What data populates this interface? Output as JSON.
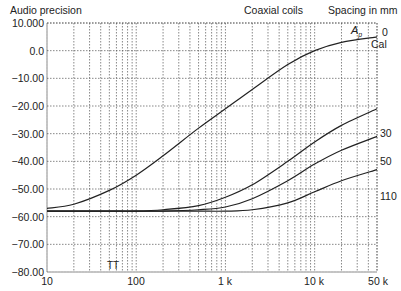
{
  "header": {
    "left_title": "Audio precision",
    "center_title": "Coaxial coils",
    "right_title": "Spacing in mm"
  },
  "annotations": {
    "ap_label": "A",
    "ap_subscript": "p",
    "tt_label": "TT",
    "cal_label": "Cal"
  },
  "y_ticks": [
    "10.000",
    "0.0",
    "−10.00",
    "−20.00",
    "−30.00",
    "−40.00",
    "−50.00",
    "−60.00",
    "−70.00",
    "−80.00"
  ],
  "x_ticks": [
    "10",
    "100",
    "1 k",
    "10 k",
    "50 k"
  ],
  "curve_labels": [
    "0",
    "30",
    "50",
    "110"
  ],
  "chart_data": {
    "type": "line",
    "title": "Coaxial coils",
    "subtitle": "Audio precision",
    "xlabel": "Frequency (Hz)",
    "ylabel": "Level (dB)",
    "xscale": "log",
    "xlim": [
      10,
      50000
    ],
    "ylim": [
      -80,
      10
    ],
    "grid": true,
    "legend_title": "Spacing in mm",
    "legend_position": "right, inline at curve ends",
    "x_tick_labels": [
      "10",
      "100",
      "1 k",
      "10 k",
      "50 k"
    ],
    "y_tick_labels": [
      "10.000",
      "0.0",
      "-10.00",
      "-20.00",
      "-30.00",
      "-40.00",
      "-50.00",
      "-60.00",
      "-70.00",
      "-80.00"
    ],
    "annotations": [
      "Ap",
      "Cal",
      "TT"
    ],
    "x": [
      10,
      20,
      50,
      100,
      200,
      500,
      1000,
      2000,
      5000,
      10000,
      20000,
      50000
    ],
    "series": [
      {
        "name": "0 (Cal)",
        "values": [
          -57,
          -55.5,
          -50.5,
          -45,
          -38,
          -28,
          -21,
          -14,
          -5,
          0,
          3,
          5
        ]
      },
      {
        "name": "30",
        "values": [
          -58,
          -58,
          -58,
          -58,
          -57.5,
          -56,
          -53,
          -48.5,
          -40,
          -33,
          -27,
          -21
        ]
      },
      {
        "name": "50",
        "values": [
          -58,
          -58,
          -58,
          -58,
          -58,
          -57.5,
          -56.5,
          -53.5,
          -47,
          -41,
          -36,
          -31
        ]
      },
      {
        "name": "110",
        "values": [
          -58,
          -58,
          -58,
          -58,
          -58,
          -58,
          -58,
          -57.5,
          -55,
          -51,
          -47,
          -43
        ]
      }
    ]
  }
}
